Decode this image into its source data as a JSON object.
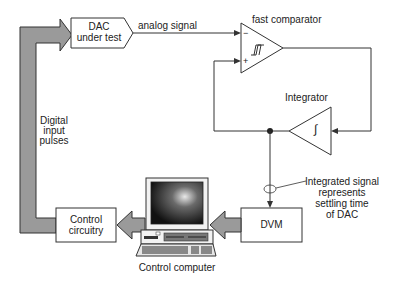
{
  "diagram": {
    "dac_box": {
      "line1": "DAC",
      "line2": "under test"
    },
    "analog_signal_label": "analog signal",
    "comparator": {
      "label": "fast comparator",
      "minus": "−",
      "plus": "+"
    },
    "integrator": {
      "label": "Integrator",
      "symbol": "∫"
    },
    "digital_label": {
      "line1": "Digital",
      "line2": "input",
      "line3": "pulses"
    },
    "control_circuitry": {
      "line1": "Control",
      "line2": "circuitry"
    },
    "dvm": {
      "label": "DVM"
    },
    "computer": {
      "label": "Control computer"
    },
    "annotation": {
      "line1": "Integrated signal",
      "line2": "represents",
      "line3": "settling time",
      "line4": "of DAC"
    },
    "colors": {
      "thick_arrow_fill": "#9a9a9a",
      "line": "#333333",
      "box_fill": "#ffffff"
    }
  }
}
